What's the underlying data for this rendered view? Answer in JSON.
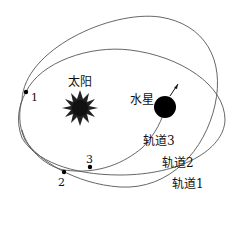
{
  "diagram": {
    "sun_label": "太阳",
    "planet_label": "水星",
    "orbits": [
      {
        "label": "轨道1"
      },
      {
        "label": "轨道2"
      },
      {
        "label": "轨道3"
      }
    ],
    "points": [
      {
        "label": "1"
      },
      {
        "label": "2"
      },
      {
        "label": "3"
      }
    ],
    "colors": {
      "line": "#555555",
      "ink": "#111111",
      "background": "#ffffff"
    }
  }
}
